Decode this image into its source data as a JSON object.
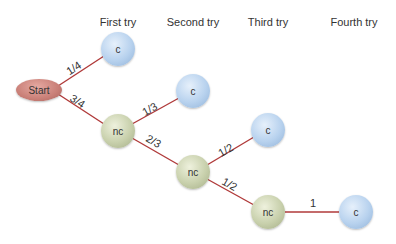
{
  "headers": [
    "First try",
    "Second try",
    "Third try",
    "Fourth try"
  ],
  "start": {
    "label": "Start"
  },
  "nodes": {
    "c1": "c",
    "nc1": "nc",
    "c2": "c",
    "nc2": "nc",
    "c3": "c",
    "nc3": "nc",
    "c4": "c"
  },
  "edges": {
    "start_c1": "1/4",
    "start_nc1": "3/4",
    "nc1_c2": "1/3",
    "nc1_nc2": "2/3",
    "nc2_c3": "1/2",
    "nc2_nc3": "1/2",
    "nc3_c4": "1"
  },
  "colors": {
    "edge": "#b03a3a",
    "c_node": "#b8d2ee",
    "nc_node": "#c8d0ac",
    "start_node": "#c97f77"
  }
}
